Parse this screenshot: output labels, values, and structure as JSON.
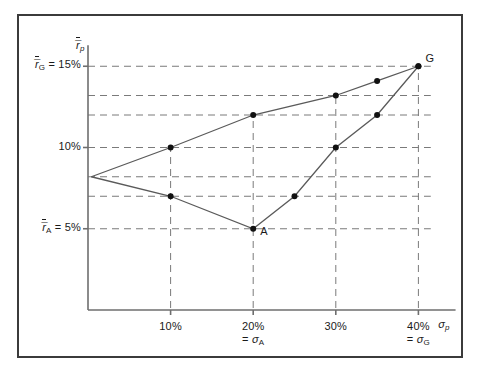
{
  "figure": {
    "background": "#ffffff",
    "border_color": "#3b3b3b",
    "axis_color": "#6e6e6e",
    "grid_color": "#7a7a7a",
    "line_color": "#5a5a5a",
    "point_color": "#111111"
  },
  "axes": {
    "y_axis_label": "r̅",
    "y_axis_sub": "p",
    "x_axis_label": "σ",
    "x_axis_sub": "p",
    "y_ticks": [
      {
        "value": 15,
        "label": "r̅",
        "sub": "G",
        "text": " = 15%",
        "full": "r̅G = 15%"
      },
      {
        "value": 10,
        "label": "",
        "sub": "",
        "text": "10%",
        "full": "10%"
      },
      {
        "value": 5,
        "label": "r̅",
        "sub": "A",
        "text": " = 5%",
        "full": "r̅A = 5%"
      }
    ],
    "x_ticks": [
      {
        "value": 10,
        "label": "10%",
        "note": ""
      },
      {
        "value": 20,
        "label": "20%",
        "note": "= σA"
      },
      {
        "value": 30,
        "label": "30%",
        "note": ""
      },
      {
        "value": 40,
        "label": "40%",
        "note": "= σG"
      }
    ]
  },
  "point_labels": [
    {
      "id": "G",
      "text": "G"
    },
    {
      "id": "A",
      "text": "A"
    }
  ],
  "chart_data": {
    "type": "line",
    "title": "",
    "subtitle": "",
    "xlabel": "σp",
    "ylabel": "r̅p",
    "xlim": [
      0,
      45
    ],
    "ylim": [
      0,
      17
    ],
    "grid": true,
    "grid_style": "dashed",
    "legend": "none",
    "xtick_labels": [
      "10%",
      "20%",
      "30%",
      "40%"
    ],
    "xtick_values": [
      10,
      20,
      30,
      40
    ],
    "ytick_labels": [
      "r̅G = 15%",
      "10%",
      "r̅A = 5%"
    ],
    "ytick_values": [
      15,
      10,
      5
    ],
    "x_gridlines": [
      10,
      20,
      30,
      40
    ],
    "y_gridlines": [
      15,
      13.2,
      12,
      10,
      8.2,
      7,
      5
    ],
    "series": [
      {
        "name": "upper-frontier",
        "points": [
          {
            "x": 0.4,
            "y": 8.2,
            "marker": false
          },
          {
            "x": 10,
            "y": 10,
            "marker": true
          },
          {
            "x": 20,
            "y": 12,
            "marker": true
          },
          {
            "x": 30,
            "y": 13.2,
            "marker": true
          },
          {
            "x": 35,
            "y": 14.1,
            "marker": true
          },
          {
            "x": 40,
            "y": 15,
            "marker": true,
            "label": "G"
          }
        ]
      },
      {
        "name": "lower-frontier",
        "points": [
          {
            "x": 0.4,
            "y": 8.2,
            "marker": false
          },
          {
            "x": 10,
            "y": 7,
            "marker": true
          },
          {
            "x": 20,
            "y": 5,
            "marker": true,
            "label": "A"
          },
          {
            "x": 25,
            "y": 7,
            "marker": true
          },
          {
            "x": 30,
            "y": 10,
            "marker": true
          },
          {
            "x": 35,
            "y": 12,
            "marker": true
          },
          {
            "x": 40,
            "y": 15,
            "marker": true,
            "label": "G"
          }
        ]
      }
    ],
    "annotations": [
      {
        "text": "= σA",
        "x": 20,
        "y": 0
      },
      {
        "text": "= σG",
        "x": 40,
        "y": 0
      }
    ]
  }
}
